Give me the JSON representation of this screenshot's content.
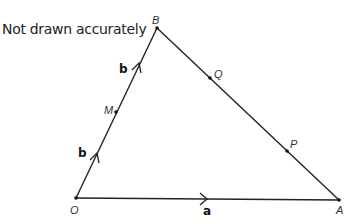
{
  "note": "Not drawn accurately",
  "points": {
    "O": {
      "label": "O",
      "x": 76,
      "y": 198
    },
    "A": {
      "label": "A",
      "x": 339,
      "y": 200
    },
    "B": {
      "label": "B",
      "x": 157,
      "y": 28
    },
    "M": {
      "label": "M",
      "x": 116,
      "y": 112
    },
    "Q": {
      "label": "Q",
      "x": 210,
      "y": 78
    },
    "P": {
      "label": "P",
      "x": 287,
      "y": 151
    }
  },
  "vectors": {
    "OA": "a",
    "OM": "b",
    "MB": "b"
  }
}
